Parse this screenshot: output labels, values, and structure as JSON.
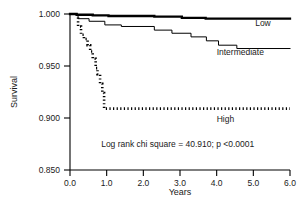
{
  "chart_data": {
    "type": "line",
    "subtype": "kaplan-meier-survival",
    "title": "",
    "xlabel": "Years",
    "ylabel": "Survival",
    "xlim": [
      0.0,
      6.0
    ],
    "ylim": [
      0.85,
      1.0
    ],
    "xticks": [
      0.0,
      1.0,
      2.0,
      3.0,
      4.0,
      5.0,
      6.0
    ],
    "xtick_labels": [
      "0.0",
      "1.0",
      "2.0",
      "3.0",
      "4.0",
      "5.0",
      "6.0"
    ],
    "yticks": [
      0.85,
      0.9,
      0.95,
      1.0
    ],
    "ytick_labels": [
      "0.850",
      "0.900",
      "0.950",
      "1.000"
    ],
    "grid": false,
    "legend_position": "inline-right-of-curve",
    "annotations": [
      {
        "name": "log-rank-statistic",
        "text": "Log rank chi square = 40.910; p <0.0001",
        "x": 0.85,
        "y": 0.872
      }
    ],
    "series": [
      {
        "name": "Low",
        "label": "Low",
        "style": "solid",
        "line_width": 2.3,
        "color": "#000000",
        "label_x": 5.05,
        "label_y": 0.9885,
        "points": [
          [
            0.0,
            1.0
          ],
          [
            0.18,
            1.0
          ],
          [
            0.18,
            0.9993
          ],
          [
            0.62,
            0.9993
          ],
          [
            0.62,
            0.9987
          ],
          [
            1.05,
            0.9987
          ],
          [
            1.05,
            0.9981
          ],
          [
            2.3,
            0.9981
          ],
          [
            2.3,
            0.9974
          ],
          [
            3.05,
            0.9974
          ],
          [
            3.05,
            0.9962
          ],
          [
            3.7,
            0.9962
          ],
          [
            3.7,
            0.9955
          ],
          [
            6.0,
            0.9955
          ]
        ]
      },
      {
        "name": "Intermediate",
        "label": "Intermediate",
        "style": "solid",
        "line_width": 1.0,
        "color": "#000000",
        "label_x": 4.0,
        "label_y": 0.9605,
        "points": [
          [
            0.0,
            1.0
          ],
          [
            0.22,
            1.0
          ],
          [
            0.22,
            0.9955
          ],
          [
            0.52,
            0.9955
          ],
          [
            0.52,
            0.993
          ],
          [
            0.95,
            0.993
          ],
          [
            0.95,
            0.9895
          ],
          [
            1.4,
            0.9895
          ],
          [
            1.4,
            0.988
          ],
          [
            2.3,
            0.988
          ],
          [
            2.3,
            0.9845
          ],
          [
            2.78,
            0.9845
          ],
          [
            2.78,
            0.9815
          ],
          [
            3.3,
            0.9815
          ],
          [
            3.3,
            0.978
          ],
          [
            3.72,
            0.978
          ],
          [
            3.72,
            0.9742
          ],
          [
            4.05,
            0.9742
          ],
          [
            4.05,
            0.97
          ],
          [
            4.55,
            0.97
          ],
          [
            4.55,
            0.9668
          ],
          [
            6.0,
            0.9668
          ]
        ]
      },
      {
        "name": "High",
        "label": "High",
        "style": "dotted",
        "line_width": 2.6,
        "color": "#000000",
        "label_x": 4.0,
        "label_y": 0.8965,
        "points": [
          [
            0.22,
            1.0
          ],
          [
            0.22,
            0.988
          ],
          [
            0.3,
            0.988
          ],
          [
            0.3,
            0.98
          ],
          [
            0.38,
            0.98
          ],
          [
            0.38,
            0.976
          ],
          [
            0.48,
            0.976
          ],
          [
            0.48,
            0.97
          ],
          [
            0.55,
            0.97
          ],
          [
            0.55,
            0.964
          ],
          [
            0.62,
            0.964
          ],
          [
            0.62,
            0.957
          ],
          [
            0.7,
            0.957
          ],
          [
            0.7,
            0.948
          ],
          [
            0.75,
            0.948
          ],
          [
            0.75,
            0.942
          ],
          [
            0.82,
            0.942
          ],
          [
            0.82,
            0.933
          ],
          [
            0.88,
            0.933
          ],
          [
            0.88,
            0.924
          ],
          [
            0.93,
            0.924
          ],
          [
            0.93,
            0.909
          ],
          [
            1.05,
            0.909
          ],
          [
            6.0,
            0.909
          ]
        ]
      }
    ]
  },
  "axes": {
    "y_title": "Survival",
    "x_title": "Years"
  }
}
